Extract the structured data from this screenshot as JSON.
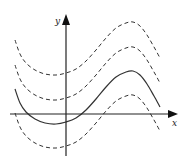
{
  "figure": {
    "axes": {
      "x_label": "x",
      "y_label": "y",
      "origin_px": [
        66,
        114
      ]
    },
    "colors": {
      "background": "#ffffff",
      "stroke": "#333333",
      "axis": "#222222"
    },
    "curves": [
      {
        "name": "curve-shift-plus-2",
        "style": "dashed",
        "offset_px": -49
      },
      {
        "name": "curve-shift-plus-1",
        "style": "dashed",
        "offset_px": -24
      },
      {
        "name": "curve-base",
        "style": "solid",
        "offset_px": 0
      },
      {
        "name": "curve-shift-minus-1",
        "style": "dashed",
        "offset_px": 24
      }
    ],
    "base_curve_points_px": [
      [
        15,
        89
      ],
      [
        20,
        103
      ],
      [
        26,
        112
      ],
      [
        35,
        119
      ],
      [
        45,
        123
      ],
      [
        56,
        124
      ],
      [
        66,
        122
      ],
      [
        76,
        118
      ],
      [
        86,
        110
      ],
      [
        96,
        99
      ],
      [
        106,
        87
      ],
      [
        116,
        77
      ],
      [
        126,
        72
      ],
      [
        133,
        71
      ],
      [
        140,
        75
      ],
      [
        147,
        84
      ],
      [
        154,
        96
      ],
      [
        160,
        107
      ]
    ]
  }
}
